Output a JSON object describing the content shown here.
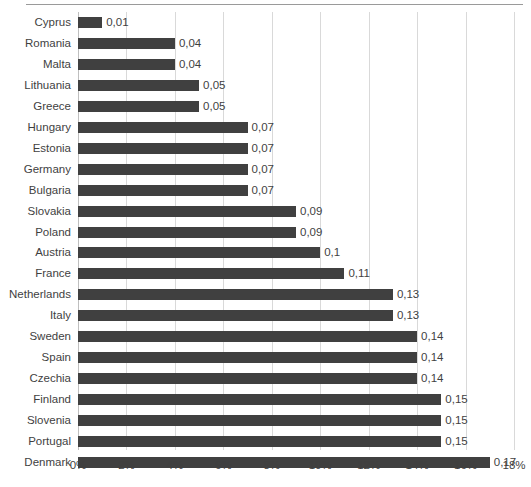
{
  "chart_data": {
    "type": "bar",
    "orientation": "horizontal",
    "title": "",
    "subtitle": "",
    "xlabel": "",
    "ylabel": "",
    "xlim": [
      0,
      18
    ],
    "grid": true,
    "legend": null,
    "value_label_format": "comma-decimal",
    "categories": [
      "Cyprus",
      "Romania",
      "Malta",
      "Lithuania",
      "Greece",
      "Hungary",
      "Estonia",
      "Germany",
      "Bulgaria",
      "Slovakia",
      "Poland",
      "Austria",
      "France",
      "Netherlands",
      "Italy",
      "Sweden",
      "Spain",
      "Czechia",
      "Finland",
      "Slovenia",
      "Portugal",
      "Denmark"
    ],
    "values": [
      0.01,
      0.04,
      0.04,
      0.05,
      0.05,
      0.07,
      0.07,
      0.07,
      0.07,
      0.09,
      0.09,
      0.1,
      0.11,
      0.13,
      0.13,
      0.14,
      0.14,
      0.14,
      0.15,
      0.15,
      0.15,
      0.17
    ],
    "value_labels": [
      "0,01",
      "0,04",
      "0,04",
      "0,05",
      "0,05",
      "0,07",
      "0,07",
      "0,07",
      "0,07",
      "0,09",
      "0,09",
      "0,1",
      "0,11",
      "0,13",
      "0,13",
      "0,14",
      "0,14",
      "0,14",
      "0,15",
      "0,15",
      "0,15",
      "0,17"
    ],
    "x_ticks": [
      {
        "value": 0,
        "label": "0%"
      },
      {
        "value": 2,
        "label": "2%"
      },
      {
        "value": 4,
        "label": "4%"
      },
      {
        "value": 6,
        "label": "6%"
      },
      {
        "value": 8,
        "label": "8%"
      },
      {
        "value": 10,
        "label": "10%"
      },
      {
        "value": 12,
        "label": "12%"
      },
      {
        "value": 14,
        "label": "14%"
      },
      {
        "value": 16,
        "label": "16%"
      },
      {
        "value": 18,
        "label": "18%"
      }
    ],
    "colors": {
      "bar": "#404040",
      "gridline": "#d9d9d9",
      "axis": "#bfbfbf",
      "text": "#3f3f3f",
      "background": "#ffffff"
    }
  }
}
